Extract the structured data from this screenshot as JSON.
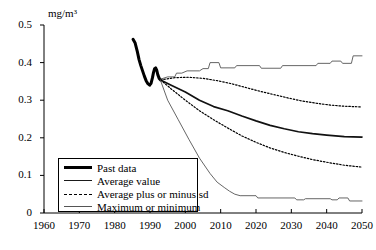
{
  "chart_data": {
    "type": "line",
    "title": "",
    "xlabel": "",
    "ylabel": "mg/m3",
    "ylabel_display": "mg/m³",
    "xlim": [
      1960,
      2050
    ],
    "ylim": [
      0,
      0.5
    ],
    "grid": false,
    "legend_position": "lower-left",
    "x_ticks": [
      "1960",
      "1970",
      "1980",
      "1990",
      "2000",
      "2010",
      "2020",
      "2030",
      "2040",
      "2050"
    ],
    "x_tick_values": [
      1960,
      1970,
      1980,
      1990,
      2000,
      2010,
      2020,
      2030,
      2040,
      2050
    ],
    "y_ticks": [
      "0",
      "0.1",
      "0.2",
      "0.3",
      "0.4",
      "0.5"
    ],
    "y_tick_values": [
      0,
      0.1,
      0.2,
      0.3,
      0.4,
      0.5
    ],
    "series": [
      {
        "name": "Past data",
        "style": "solid-thick",
        "color": "#000000",
        "points": [
          [
            1985.2,
            0.462
          ],
          [
            1985.8,
            0.452
          ],
          [
            1986.4,
            0.43
          ],
          [
            1986.9,
            0.408
          ],
          [
            1987.4,
            0.392
          ],
          [
            1987.9,
            0.378
          ],
          [
            1988.4,
            0.364
          ],
          [
            1988.9,
            0.352
          ],
          [
            1989.4,
            0.344
          ],
          [
            1989.9,
            0.34
          ],
          [
            1990.3,
            0.345
          ],
          [
            1990.7,
            0.36
          ],
          [
            1991.0,
            0.374
          ],
          [
            1991.3,
            0.384
          ],
          [
            1991.6,
            0.386
          ],
          [
            1991.9,
            0.38
          ],
          [
            1992.2,
            0.368
          ],
          [
            1992.6,
            0.358
          ],
          [
            1993.0,
            0.354
          ]
        ]
      },
      {
        "name": "Average value",
        "style": "solid-medium",
        "color": "#111111",
        "points": [
          [
            1993.0,
            0.354
          ],
          [
            1996,
            0.34
          ],
          [
            2000,
            0.322
          ],
          [
            2004,
            0.3
          ],
          [
            2008,
            0.283
          ],
          [
            2012,
            0.272
          ],
          [
            2016,
            0.258
          ],
          [
            2020,
            0.245
          ],
          [
            2024,
            0.233
          ],
          [
            2028,
            0.224
          ],
          [
            2032,
            0.216
          ],
          [
            2036,
            0.211
          ],
          [
            2040,
            0.207
          ],
          [
            2045,
            0.203
          ],
          [
            2050,
            0.202
          ]
        ]
      },
      {
        "name": "Average plus sd",
        "style": "dashed",
        "color": "#000000",
        "points": [
          [
            1993.0,
            0.354
          ],
          [
            1997,
            0.36
          ],
          [
            2001,
            0.361
          ],
          [
            2005,
            0.358
          ],
          [
            2009,
            0.352
          ],
          [
            2013,
            0.344
          ],
          [
            2017,
            0.334
          ],
          [
            2021,
            0.324
          ],
          [
            2025,
            0.315
          ],
          [
            2029,
            0.306
          ],
          [
            2033,
            0.298
          ],
          [
            2037,
            0.292
          ],
          [
            2041,
            0.287
          ],
          [
            2045,
            0.284
          ],
          [
            2050,
            0.282
          ]
        ]
      },
      {
        "name": "Average minus sd",
        "style": "dashed",
        "color": "#000000",
        "points": [
          [
            1993.0,
            0.354
          ],
          [
            1996,
            0.33
          ],
          [
            2000,
            0.3
          ],
          [
            2004,
            0.272
          ],
          [
            2008,
            0.248
          ],
          [
            2012,
            0.226
          ],
          [
            2016,
            0.205
          ],
          [
            2020,
            0.188
          ],
          [
            2024,
            0.173
          ],
          [
            2028,
            0.161
          ],
          [
            2032,
            0.151
          ],
          [
            2036,
            0.142
          ],
          [
            2040,
            0.135
          ],
          [
            2045,
            0.127
          ],
          [
            2050,
            0.122
          ]
        ]
      },
      {
        "name": "Maximum",
        "style": "solid-thin",
        "color": "#555555",
        "points": [
          [
            1993.0,
            0.356
          ],
          [
            1995,
            0.362
          ],
          [
            1997,
            0.362
          ],
          [
            1997.5,
            0.372
          ],
          [
            1999,
            0.372
          ],
          [
            2000.5,
            0.378
          ],
          [
            2004,
            0.378
          ],
          [
            2005,
            0.384
          ],
          [
            2006.5,
            0.384
          ],
          [
            2007,
            0.4
          ],
          [
            2009.5,
            0.4
          ],
          [
            2010,
            0.386
          ],
          [
            2014,
            0.386
          ],
          [
            2014.5,
            0.392
          ],
          [
            2021,
            0.392
          ],
          [
            2021.5,
            0.385
          ],
          [
            2027,
            0.385
          ],
          [
            2027.5,
            0.392
          ],
          [
            2037,
            0.392
          ],
          [
            2037.5,
            0.398
          ],
          [
            2041,
            0.398
          ],
          [
            2041.5,
            0.404
          ],
          [
            2044,
            0.404
          ],
          [
            2044.5,
            0.398
          ],
          [
            2047,
            0.398
          ],
          [
            2047.5,
            0.418
          ],
          [
            2050,
            0.418
          ]
        ]
      },
      {
        "name": "Minimum",
        "style": "solid-thin",
        "color": "#555555",
        "points": [
          [
            1993.0,
            0.352
          ],
          [
            1995,
            0.3
          ],
          [
            1998,
            0.248
          ],
          [
            2001,
            0.196
          ],
          [
            2004,
            0.146
          ],
          [
            2007,
            0.105
          ],
          [
            2009,
            0.082
          ],
          [
            2011,
            0.068
          ],
          [
            2012.5,
            0.058
          ],
          [
            2014,
            0.05
          ],
          [
            2015.5,
            0.046
          ],
          [
            2020,
            0.046
          ],
          [
            2020.5,
            0.04
          ],
          [
            2031,
            0.04
          ],
          [
            2031.5,
            0.035
          ],
          [
            2033.5,
            0.035
          ],
          [
            2034,
            0.038
          ],
          [
            2041,
            0.038
          ],
          [
            2041.5,
            0.035
          ],
          [
            2043,
            0.035
          ],
          [
            2043.5,
            0.04
          ],
          [
            2046,
            0.04
          ],
          [
            2046.5,
            0.032
          ],
          [
            2050,
            0.032
          ]
        ]
      }
    ],
    "legend": [
      {
        "label": "Past data",
        "style": "solid-thick"
      },
      {
        "label": "Average value",
        "style": "solid-medium"
      },
      {
        "label": "Average plus or minus sd",
        "style": "dashed"
      },
      {
        "label": "Maximum or minimum",
        "style": "solid-thin"
      }
    ]
  }
}
